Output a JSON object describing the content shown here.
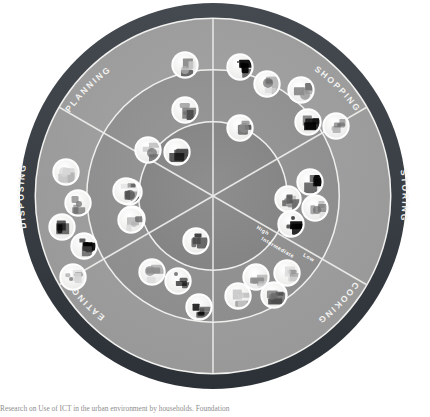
{
  "figure": {
    "type": "radial-wheel-diagram",
    "bottom_caption": "Research on Use of ICT in the urban environment by households. Foundation"
  },
  "colors": {
    "page_background": "#ffffff",
    "outer_band": "#3b4046",
    "outer_band_edge": "#22262a",
    "ring_outer": "#9c9c9c",
    "ring_middle": "#8f8f8f",
    "ring_inner": "#868686",
    "ring_core": "#7e7e7e",
    "divider_line": "#e8e8e6",
    "ring_boundary_line": "#f0f0ee",
    "band_text": "#f2f2f0",
    "level_text": "#ffffff",
    "icon_disc": "#f4f4f2",
    "icon_disc_edge": "#ffffff",
    "icon_art_dark": "#4a4a4a",
    "icon_art_mid": "#8d8d8d",
    "icon_art_light": "#d6d6d6"
  },
  "sectors": [
    {
      "id": "planning",
      "label": "PLANNING",
      "start_deg": 240,
      "end_deg": 300
    },
    {
      "id": "shopping",
      "label": "SHOPPING",
      "start_deg": 300,
      "end_deg": 360
    },
    {
      "id": "storing",
      "label": "STORING",
      "start_deg": 0,
      "end_deg": 60
    },
    {
      "id": "cooking",
      "label": "COOKING",
      "start_deg": 60,
      "end_deg": 120
    },
    {
      "id": "eating",
      "label": "EATING",
      "start_deg": 120,
      "end_deg": 180
    },
    {
      "id": "disposing",
      "label": "DISPOSING",
      "start_deg": 180,
      "end_deg": 240
    }
  ],
  "levels": [
    {
      "id": "high",
      "label": "High",
      "ring": "inner"
    },
    {
      "id": "intermediate",
      "label": "Intermediate",
      "ring": "middle"
    },
    {
      "id": "low",
      "label": "Low",
      "ring": "outer"
    }
  ],
  "geometry": {
    "center_x": 213,
    "center_y": 196,
    "r_outer_band_outside": 194,
    "r_outer_band_inside": 178,
    "r_ring_outer_inside": 126,
    "r_ring_middle_inside": 74,
    "icon_radius": 12.4
  },
  "icons": [
    {
      "name": "notepad-checklist-icon",
      "sector": "planning",
      "ring": "outer",
      "x": 185,
      "y": 65
    },
    {
      "name": "recipe-book-icon",
      "sector": "planning",
      "ring": "middle",
      "x": 185,
      "y": 110
    },
    {
      "name": "open-book-icon",
      "sector": "planning",
      "ring": "middle",
      "x": 148,
      "y": 150
    },
    {
      "name": "cookbook-binder-icon",
      "sector": "planning",
      "ring": "middle",
      "x": 177,
      "y": 152
    },
    {
      "name": "shopping-list-pad-icon",
      "sector": "planning",
      "ring": "inner",
      "x": 129,
      "y": 192
    },
    {
      "name": "calendar-planner-icon",
      "sector": "planning",
      "ring": "inner",
      "x": 132,
      "y": 219
    },
    {
      "name": "magnifier-search-icon",
      "sector": "shopping",
      "ring": "outer",
      "x": 240,
      "y": 67
    },
    {
      "name": "shopping-bags-icon",
      "sector": "shopping",
      "ring": "outer",
      "x": 267,
      "y": 84
    },
    {
      "name": "credit-card-icon",
      "sector": "shopping",
      "ring": "outer",
      "x": 301,
      "y": 90
    },
    {
      "name": "barcode-scanner-icon",
      "sector": "shopping",
      "ring": "outer",
      "x": 308,
      "y": 122
    },
    {
      "name": "laptop-online-shop-icon",
      "sector": "shopping",
      "ring": "outer",
      "x": 336,
      "y": 126
    },
    {
      "name": "tablet-device-icon",
      "sector": "shopping",
      "ring": "middle",
      "x": 240,
      "y": 128
    },
    {
      "name": "smart-fridge-panel-icon",
      "sector": "storing",
      "ring": "middle",
      "x": 310,
      "y": 182
    },
    {
      "name": "freezer-unit-icon",
      "sector": "storing",
      "ring": "middle",
      "x": 288,
      "y": 199
    },
    {
      "name": "storage-jar-icon",
      "sector": "storing",
      "ring": "middle",
      "x": 315,
      "y": 208
    },
    {
      "name": "vacuum-sealer-icon",
      "sector": "storing",
      "ring": "inner",
      "x": 291,
      "y": 224
    },
    {
      "name": "stove-hob-icon",
      "sector": "cooking",
      "ring": "inner",
      "x": 256,
      "y": 277
    },
    {
      "name": "blender-mixer-icon",
      "sector": "cooking",
      "ring": "inner",
      "x": 287,
      "y": 273
    },
    {
      "name": "kitchen-scale-icon",
      "sector": "cooking",
      "ring": "middle",
      "x": 238,
      "y": 296
    },
    {
      "name": "microwave-oven-icon",
      "sector": "cooking",
      "ring": "middle",
      "x": 274,
      "y": 295
    },
    {
      "name": "dinner-plate-icon",
      "sector": "eating",
      "ring": "inner",
      "x": 196,
      "y": 241
    },
    {
      "name": "tableware-set-icon",
      "sector": "eating",
      "ring": "inner",
      "x": 152,
      "y": 272
    },
    {
      "name": "serving-tray-icon",
      "sector": "eating",
      "ring": "middle",
      "x": 178,
      "y": 281
    },
    {
      "name": "television-meal-icon",
      "sector": "eating",
      "ring": "middle",
      "x": 199,
      "y": 307
    },
    {
      "name": "waste-sorting-bins-icon",
      "sector": "disposing",
      "ring": "outer",
      "x": 66,
      "y": 172
    },
    {
      "name": "recycling-station-icon",
      "sector": "disposing",
      "ring": "outer",
      "x": 78,
      "y": 203
    },
    {
      "name": "compost-bin-icon",
      "sector": "disposing",
      "ring": "outer",
      "x": 62,
      "y": 227
    },
    {
      "name": "waste-chute-icon",
      "sector": "disposing",
      "ring": "outer",
      "x": 84,
      "y": 246
    },
    {
      "name": "bin-collection-app-icon",
      "sector": "disposing",
      "ring": "outer",
      "x": 73,
      "y": 277
    },
    {
      "name": "food-waste-tracker-icon",
      "sector": "disposing",
      "ring": "middle",
      "x": 126,
      "y": 191
    },
    {
      "name": "label-printer-icon",
      "sector": "disposing",
      "ring": "middle",
      "x": 131,
      "y": 220
    }
  ]
}
